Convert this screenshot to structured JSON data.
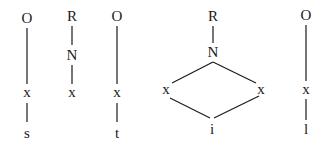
{
  "diagram": {
    "type": "lattice-graphs",
    "graphs": [
      {
        "id": "g1",
        "nodes": [
          {
            "id": "g1_top",
            "label": "O",
            "x": 27,
            "y": 18
          },
          {
            "id": "g1_mid",
            "label": "x",
            "x": 27,
            "y": 93
          },
          {
            "id": "g1_bot",
            "label": "s",
            "x": 27,
            "y": 134
          }
        ],
        "edges": [
          [
            "g1_top",
            "g1_mid"
          ],
          [
            "g1_mid",
            "g1_bot"
          ]
        ]
      },
      {
        "id": "g2",
        "nodes": [
          {
            "id": "g2_top",
            "label": "R",
            "x": 72,
            "y": 16
          },
          {
            "id": "g2_mid",
            "label": "N",
            "x": 72,
            "y": 55
          },
          {
            "id": "g2_bot",
            "label": "x",
            "x": 72,
            "y": 93
          }
        ],
        "edges": [
          [
            "g2_top",
            "g2_mid"
          ],
          [
            "g2_mid",
            "g2_bot"
          ]
        ]
      },
      {
        "id": "g3",
        "nodes": [
          {
            "id": "g3_top",
            "label": "O",
            "x": 117,
            "y": 16
          },
          {
            "id": "g3_mid",
            "label": "x",
            "x": 117,
            "y": 93
          },
          {
            "id": "g3_bot",
            "label": "t",
            "x": 117,
            "y": 134
          }
        ],
        "edges": [
          [
            "g3_top",
            "g3_mid"
          ],
          [
            "g3_mid",
            "g3_bot"
          ]
        ]
      },
      {
        "id": "g4",
        "nodes": [
          {
            "id": "g4_top",
            "label": "R",
            "x": 213,
            "y": 16
          },
          {
            "id": "g4_n",
            "label": "N",
            "x": 213,
            "y": 53
          },
          {
            "id": "g4_left",
            "label": "x",
            "x": 167,
            "y": 90
          },
          {
            "id": "g4_right",
            "label": "x",
            "x": 260,
            "y": 90
          },
          {
            "id": "g4_bot",
            "label": "i",
            "x": 212,
            "y": 130
          }
        ],
        "edges": [
          [
            "g4_top",
            "g4_n"
          ],
          [
            "g4_n",
            "g4_left"
          ],
          [
            "g4_n",
            "g4_right"
          ],
          [
            "g4_left",
            "g4_bot"
          ],
          [
            "g4_right",
            "g4_bot"
          ]
        ]
      },
      {
        "id": "g5",
        "nodes": [
          {
            "id": "g5_top",
            "label": "O",
            "x": 306,
            "y": 16
          },
          {
            "id": "g5_mid",
            "label": "x",
            "x": 306,
            "y": 90
          },
          {
            "id": "g5_bot",
            "label": "l",
            "x": 306,
            "y": 130
          }
        ],
        "edges": [
          [
            "g5_top",
            "g5_mid"
          ],
          [
            "g5_mid",
            "g5_bot"
          ]
        ]
      }
    ]
  },
  "labels": {
    "g1": {
      "top": "O",
      "mid": "x",
      "bot": "s"
    },
    "g2": {
      "top": "R",
      "mid": "N",
      "bot": "x"
    },
    "g3": {
      "top": "O",
      "mid": "x",
      "bot": "t"
    },
    "g4": {
      "top": "R",
      "n": "N",
      "left": "x",
      "right": "x",
      "bot": "i"
    },
    "g5": {
      "top": "O",
      "mid": "x",
      "bot": "l"
    }
  },
  "colors": {
    "ink": "#1a1a1a",
    "background": "#ffffff"
  }
}
